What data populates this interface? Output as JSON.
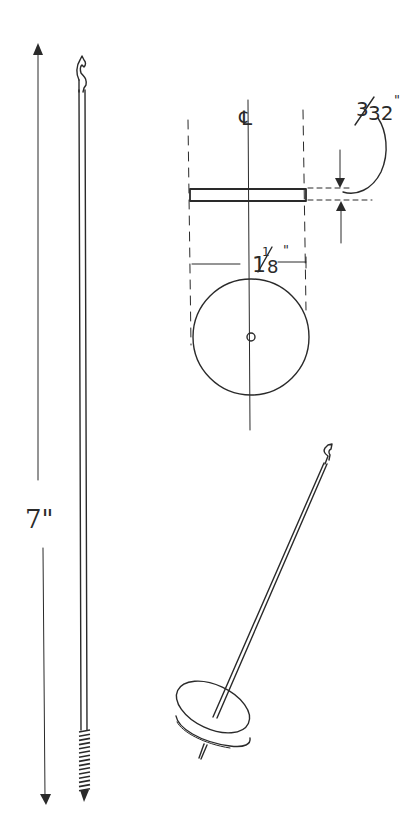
{
  "drawing": {
    "subject": "spindle with disc whorl",
    "labels": {
      "length": "7\"",
      "centerline": "℄",
      "thickness": "3/32\"",
      "thickness_num": "3",
      "thickness_den": "32",
      "thickness_inch": "\"",
      "diameter_whole": "1",
      "diameter_num": "1",
      "diameter_den": "8",
      "diameter_inch": "\""
    },
    "dimensions": {
      "spindle_length_in": 7,
      "whorl_diameter_in": 1.125,
      "whorl_thickness_in": 0.09375
    },
    "views": [
      "side view of spindle",
      "edge view of whorl",
      "plan view of whorl",
      "perspective of assembled spindle"
    ],
    "ink_color": "#2a2a2a",
    "background": "#ffffff"
  }
}
